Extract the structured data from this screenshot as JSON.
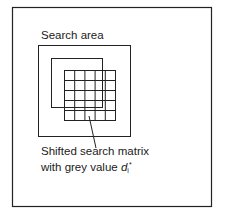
{
  "diagram": {
    "labels": {
      "search_area": "Search area",
      "caption_line1": "Shifted search matrix",
      "caption_line2_prefix": "with grey value ",
      "symbol_base": "d",
      "symbol_sub": "i",
      "symbol_sup": "*"
    },
    "shapes": {
      "outer_frame": {
        "x": 12,
        "y": 7,
        "w": 199,
        "h": 199
      },
      "search_area_box": {
        "x": 38,
        "y": 45,
        "w": 92,
        "h": 91
      },
      "reference_matrix_box": {
        "x": 51,
        "y": 58,
        "w": 51,
        "h": 49
      },
      "shifted_search_matrix": {
        "x": 64,
        "y": 70,
        "w": 51,
        "h": 50,
        "rows": 5,
        "cols": 5
      },
      "leader_line": {
        "x1": 89,
        "y1": 116,
        "x2": 96,
        "y2": 148
      }
    },
    "colors": {
      "stroke": "#222222",
      "background": "#ffffff"
    }
  }
}
